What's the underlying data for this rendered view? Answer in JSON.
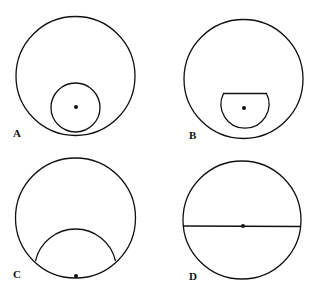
{
  "panels": [
    {
      "label": "A",
      "description": "Large circle with smaller full circle inside, tangent near bottom, dot at small circle center"
    },
    {
      "label": "B",
      "description": "Large circle with truncated circle (flat top) inside near bottom, dot at center"
    },
    {
      "label": "C",
      "description": "Large circle with arc spanning lower region, dot on bottom of circumference"
    },
    {
      "label": "D",
      "description": "Circle with horizontal diameter line and dot at center"
    }
  ],
  "colors": {
    "stroke": "#111111",
    "background": "#ffffff"
  }
}
